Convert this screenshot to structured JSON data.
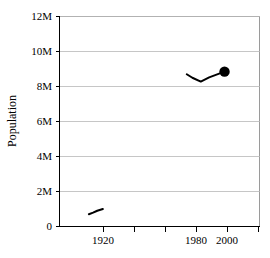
{
  "chart_data": {
    "type": "line",
    "title": "",
    "subtitle": "",
    "xlabel": "",
    "ylabel": "Population",
    "xlim": [
      1889,
      2032
    ],
    "ylim": [
      0,
      12000000
    ],
    "grid": true,
    "grid_axis": "y",
    "legend": false,
    "y_ticks": [
      0,
      2000000,
      4000000,
      6000000,
      8000000,
      10000000,
      12000000
    ],
    "y_tick_labels": [
      "0",
      "2M",
      "4M",
      "6M",
      "8M",
      "10M",
      "12M"
    ],
    "x_ticks": [
      1920,
      1940,
      1960,
      1980,
      2000,
      2020
    ],
    "x_tick_labels": [
      "1920",
      "",
      "",
      "1980",
      "2000",
      ""
    ],
    "x_tick_labels_visible": [
      "1920",
      "1980",
      "2000"
    ],
    "series": [
      {
        "name": "early-period",
        "x": [
          1910,
          1913,
          1916,
          1920
        ],
        "values": [
          700000,
          790000,
          900000,
          1000000
        ],
        "marker": "none"
      },
      {
        "name": "late-period",
        "x": [
          1980,
          1984,
          1990,
          1996,
          2007
        ],
        "values": [
          8700000,
          8500000,
          8280000,
          8520000,
          8850000
        ],
        "marker": "none"
      }
    ],
    "markers": [
      {
        "name": "endpoint-marker",
        "x": 2007,
        "value": 8850000,
        "shape": "circle",
        "filled": true
      }
    ]
  },
  "axes": {
    "y_axis_title": "Population",
    "y_tick_0": "0",
    "y_tick_1": "2M",
    "y_tick_2": "4M",
    "y_tick_3": "6M",
    "y_tick_4": "8M",
    "y_tick_5": "10M",
    "y_tick_6": "12M",
    "x_tick_1920": "1920",
    "x_tick_1980": "1980",
    "x_tick_2000": "2000"
  },
  "colors": {
    "line": "#000000",
    "marker": "#000000",
    "grid": "#b8b8b8",
    "frame": "#9a9a9a",
    "axis": "#000000",
    "background": "#ffffff",
    "text": "#000000"
  }
}
